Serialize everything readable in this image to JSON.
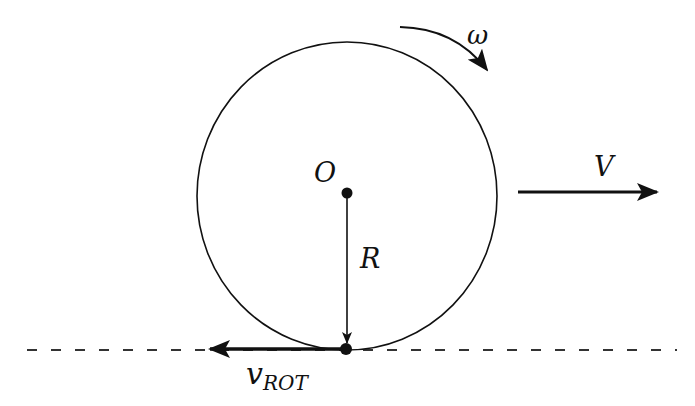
{
  "diagram": {
    "type": "rolling-wheel-kinematics",
    "colors": {
      "stroke": "#111111",
      "background": "#ffffff"
    },
    "labels": {
      "omega": "ω",
      "center": "O",
      "radius": "R",
      "velocity": "V",
      "v_rot_main": "v",
      "v_rot_sub": "ROT"
    },
    "elements": {
      "wheel": {
        "cx": 347,
        "cy": 196,
        "rx": 150,
        "ry": 154
      },
      "center_point": {
        "x": 347,
        "y": 193
      },
      "contact_point": {
        "x": 346,
        "y": 349
      },
      "ground_line": {
        "x1": 27,
        "x2": 677,
        "y": 350,
        "style": "dashed"
      },
      "velocity_arrow": {
        "x1": 518,
        "x2": 657,
        "y": 192,
        "direction": "right"
      },
      "radius_arrow": {
        "x": 347,
        "y1": 193,
        "y2": 342,
        "direction": "down"
      },
      "v_rot_arrow": {
        "x1": 346,
        "x2": 210,
        "y": 349,
        "direction": "left"
      },
      "omega_arc": {
        "from": [
          400,
          27
        ],
        "to": [
          487,
          72
        ],
        "direction": "clockwise"
      }
    }
  }
}
